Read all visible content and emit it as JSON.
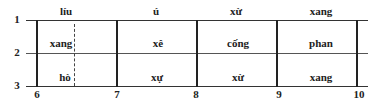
{
  "diagram": {
    "type": "grid-alignment",
    "top_labels": [
      "líu",
      "ú",
      "xừ",
      "xang"
    ],
    "row1_labels": [
      "xang",
      "xê",
      "cống",
      "phan"
    ],
    "row2_labels": [
      "hò",
      "xự",
      "xừ",
      "xang"
    ],
    "y_axis": [
      "1",
      "2",
      "3"
    ],
    "x_axis": [
      "6",
      "7",
      "8",
      "9",
      "10"
    ],
    "line_color": "#222222"
  }
}
